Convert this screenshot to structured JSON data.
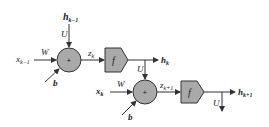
{
  "diagram": {
    "type": "recurrent-unrolled",
    "colors": {
      "node_fill": "#a9a9a9",
      "stroke": "#333333",
      "background": "#ffffff"
    },
    "step1": {
      "input": "x",
      "input_sub": "k−1",
      "weight_in": "W",
      "hidden_prev": "h",
      "hidden_prev_sub": "k−1",
      "weight_rec": "U",
      "bias": "b",
      "sum_symbol": "+",
      "preact": "z",
      "preact_sub": "k",
      "activation": "f",
      "output": "h",
      "output_sub": "k"
    },
    "step2": {
      "input": "x",
      "input_sub": "k",
      "weight_in": "W",
      "weight_rec": "U",
      "bias": "b",
      "sum_symbol": "+",
      "preact": "z",
      "preact_sub": "k+1",
      "activation": "f",
      "output": "h",
      "output_sub": "k+1",
      "weight_out": "U"
    }
  }
}
